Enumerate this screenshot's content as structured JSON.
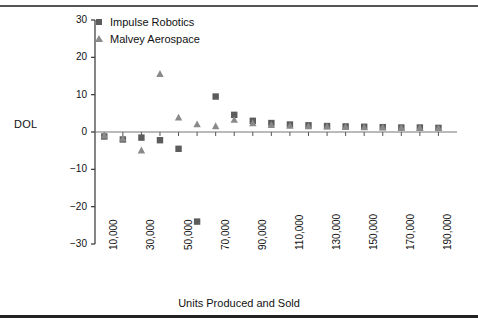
{
  "figure": {
    "y_axis_title": "DOL",
    "x_axis_title": "Units Produced and Sold"
  },
  "legend": {
    "items": [
      {
        "label": "Impulse Robotics",
        "marker": "square-marker",
        "color": "#5c5c5c"
      },
      {
        "label": "Malvey Aerospace",
        "marker": "triangle-marker",
        "color": "#8a8a8a"
      }
    ]
  },
  "axes": {
    "y_ticks": [
      "30",
      "20",
      "10",
      "0",
      "-10",
      "-20",
      "-30"
    ],
    "x_ticks": [
      "10,000",
      "30,000",
      "50,000",
      "70,000",
      "90,000",
      "110,000",
      "130,000",
      "150,000",
      "170,000",
      "190,000"
    ]
  },
  "chart_data": {
    "type": "scatter",
    "title": "",
    "xlabel": "Units Produced and Sold",
    "ylabel": "DOL",
    "xlim": [
      5000,
      200000
    ],
    "ylim": [
      -30,
      30
    ],
    "grid": false,
    "legend_position": "top-left",
    "x": [
      10000,
      20000,
      30000,
      40000,
      50000,
      60000,
      70000,
      80000,
      90000,
      100000,
      110000,
      120000,
      130000,
      140000,
      150000,
      160000,
      170000,
      180000,
      190000
    ],
    "series": [
      {
        "name": "Impulse Robotics",
        "marker": "square",
        "color": "#5c5c5c",
        "values": [
          -1.2,
          -2.0,
          -1.5,
          -2.2,
          -4.5,
          -24.0,
          9.5,
          4.6,
          3.0,
          2.4,
          2.0,
          1.8,
          1.6,
          1.5,
          1.4,
          1.3,
          1.2,
          1.2,
          1.1
        ]
      },
      {
        "name": "Malvey Aerospace",
        "marker": "triangle",
        "color": "#8a8a8a",
        "values": [
          -1.0,
          -1.8,
          -5.0,
          15.5,
          3.8,
          2.0,
          1.5,
          3.2,
          2.3,
          1.8,
          1.6,
          1.5,
          1.4,
          1.3,
          1.2,
          1.2,
          1.1,
          1.1,
          1.0
        ]
      }
    ]
  }
}
